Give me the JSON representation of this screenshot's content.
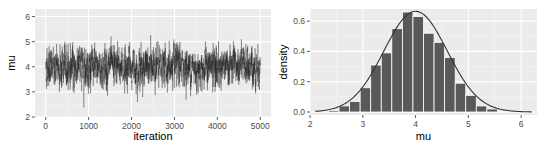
{
  "colors": {
    "panel_bg": "#ebebeb",
    "grid_major": "#ffffff",
    "grid_minor": "#f5f5f5",
    "trace_line": "#1a1a1a",
    "bar_fill": "#595959",
    "bar_outline": "#ffffff",
    "density_line": "#333333",
    "tick_text": "#4d4d4d"
  },
  "chart_data": [
    {
      "type": "line",
      "title": "",
      "xlabel": "iteration",
      "ylabel": "mu",
      "xlim": [
        -250,
        5250
      ],
      "ylim": [
        2.0,
        6.3
      ],
      "xticks": [
        0,
        1000,
        2000,
        3000,
        4000,
        5000
      ],
      "yticks": [
        2,
        3,
        4,
        5,
        6
      ],
      "grid": true,
      "description": "MCMC trace plot of mu over 5000 iterations, fluctuating around ~4 with range ~2.1 to ~6.2",
      "series": [
        {
          "name": "mu",
          "summary": {
            "n": 5000,
            "center": 4.0,
            "min": 2.1,
            "max": 6.2,
            "typical_band": [
              3.0,
              5.0
            ]
          }
        }
      ]
    },
    {
      "type": "bar",
      "title": "",
      "xlabel": "mu",
      "ylabel": "density",
      "xlim": [
        2.0,
        6.3
      ],
      "ylim": [
        0.0,
        0.68
      ],
      "xticks": [
        2,
        3,
        4,
        5,
        6
      ],
      "yticks": [
        0.0,
        0.2,
        0.4,
        0.6
      ],
      "yticklabels": [
        "0.0",
        "0.2",
        "0.4",
        "0.6"
      ],
      "grid": true,
      "bin_width": 0.2,
      "categories": [
        2.45,
        2.65,
        2.85,
        3.05,
        3.25,
        3.45,
        3.65,
        3.85,
        4.05,
        4.25,
        4.45,
        4.65,
        4.85,
        5.05,
        5.25,
        5.45
      ],
      "values": [
        0.01,
        0.04,
        0.07,
        0.16,
        0.31,
        0.39,
        0.55,
        0.66,
        0.63,
        0.52,
        0.46,
        0.36,
        0.19,
        0.11,
        0.04,
        0.02
      ],
      "overlay": {
        "type": "line",
        "name": "normal density",
        "mean": 4.0,
        "sd": 0.6,
        "x_range": [
          2.1,
          6.2
        ]
      }
    }
  ],
  "labels": {
    "left": {
      "xlabel": "iteration",
      "ylabel": "mu",
      "xticks": [
        "0",
        "1000",
        "2000",
        "3000",
        "4000",
        "5000"
      ],
      "yticks": [
        "2",
        "3",
        "4",
        "5",
        "6"
      ]
    },
    "right": {
      "xlabel": "mu",
      "ylabel": "density",
      "xticks": [
        "2",
        "3",
        "4",
        "5",
        "6"
      ],
      "yticks": [
        "0.0",
        "0.2",
        "0.4",
        "0.6"
      ]
    }
  }
}
